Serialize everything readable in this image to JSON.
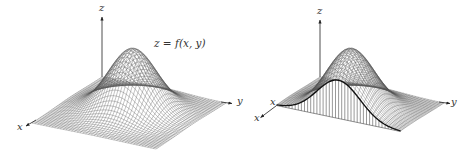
{
  "figure": {
    "panels": [
      {
        "id": "left",
        "description": "3D wireframe surface of a bump-shaped function",
        "axes": {
          "x": "x",
          "y": "y",
          "z": "z"
        },
        "annotation": "z = f(x, y)"
      },
      {
        "id": "right",
        "description": "Same surface cut by a vertical plane, cross-section curve with vertical hatching",
        "axes": {
          "x": "x",
          "y": "y",
          "z": "z"
        },
        "cross_section_label": "x"
      }
    ],
    "colors": {
      "mesh": "#555555",
      "axis": "#222222",
      "curve": "#111111",
      "background": "#ffffff"
    }
  }
}
